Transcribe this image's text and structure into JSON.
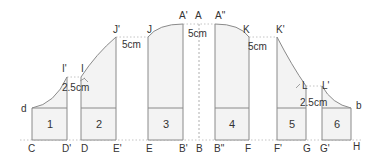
{
  "diagram": {
    "colors": {
      "stroke": "#8a8a8a",
      "fill": "#f3f3f3",
      "dashed": "#9a9a9a",
      "text": "#333333"
    },
    "pieces": [
      {
        "id": "1",
        "label": "1"
      },
      {
        "id": "2",
        "label": "2"
      },
      {
        "id": "3",
        "label": "3"
      },
      {
        "id": "4",
        "label": "4"
      },
      {
        "id": "5",
        "label": "5"
      },
      {
        "id": "6",
        "label": "6"
      }
    ],
    "top_points": {
      "d": "d",
      "I_prime": "I'",
      "I": "I",
      "J_prime": "J'",
      "J": "J",
      "A_prime": "A'",
      "A": "A",
      "A_dprime": "A\"",
      "K": "K",
      "K_prime": "K'",
      "L": "L",
      "L_prime": "L'",
      "b": "b"
    },
    "bottom_points": {
      "C": "C",
      "D_prime": "D'",
      "D": "D",
      "E_prime": "E'",
      "E": "E",
      "B_prime": "B'",
      "B": "B",
      "B_dprime": "B\"",
      "F": "F",
      "F_prime": "F'",
      "G": "G",
      "G_prime": "G'",
      "H": "H"
    },
    "dimensions": {
      "left_small": "2.5cm",
      "left_large": "5cm",
      "center": "5cm",
      "right_large": "5cm",
      "right_small": "2.5cm"
    }
  }
}
